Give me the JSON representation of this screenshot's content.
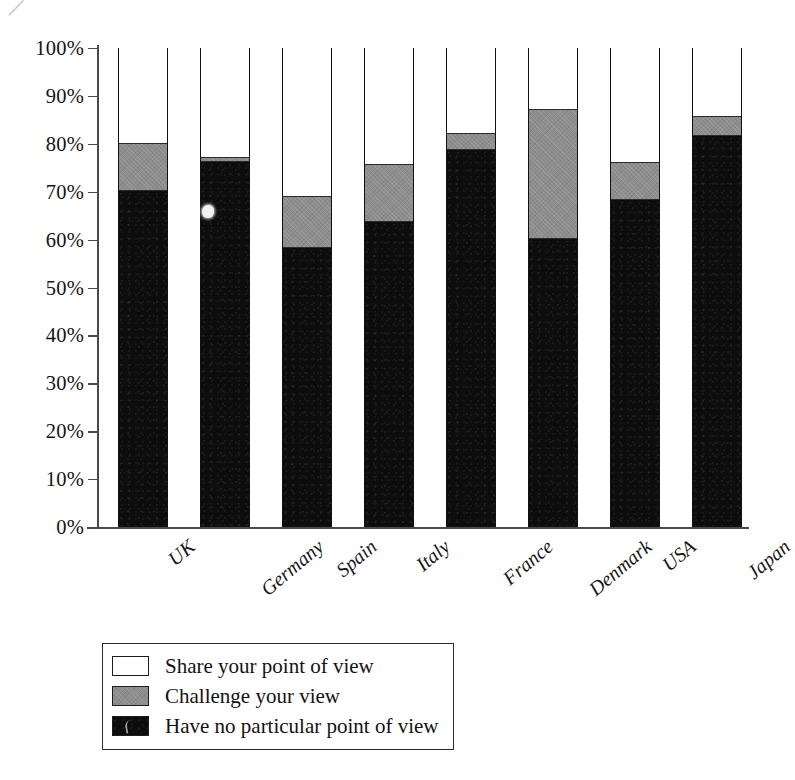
{
  "chart_data": {
    "type": "bar",
    "subtype": "stacked-100-percent",
    "title": "",
    "xlabel": "",
    "ylabel": "",
    "ylim": [
      0,
      100
    ],
    "yticks": [
      "0%",
      "10%",
      "20%",
      "30%",
      "40%",
      "50%",
      "60%",
      "70%",
      "80%",
      "90%",
      "100%"
    ],
    "ytick_values": [
      0,
      10,
      20,
      30,
      40,
      50,
      60,
      70,
      80,
      90,
      100
    ],
    "grid": false,
    "legend_position": "bottom-left",
    "categories": [
      "UK",
      "Germany",
      "Spain",
      "Italy",
      "France",
      "Denmark",
      "USA",
      "Japan"
    ],
    "series": [
      {
        "name": "Have no particular point of view",
        "color": "#0d0d0d",
        "values": [
          70,
          76,
          58,
          63.5,
          78.5,
          60,
          68,
          81.5
        ]
      },
      {
        "name": "Challenge your view",
        "color": "#8d8d8d",
        "values": [
          10,
          1,
          11,
          12,
          3.5,
          27,
          8,
          4
        ]
      },
      {
        "name": "Share your point of view",
        "color": "#ffffff",
        "values": [
          20,
          23,
          31,
          24.5,
          18,
          13,
          24,
          14.5
        ]
      }
    ],
    "cumulative_tops": {
      "black": [
        70,
        76,
        58,
        63.5,
        78.5,
        60,
        68,
        81.5
      ],
      "gray": [
        80,
        77,
        69,
        75.5,
        82,
        87,
        76,
        85.5
      ],
      "white": [
        100,
        100,
        100,
        100,
        100,
        100,
        100,
        100
      ]
    }
  },
  "legend": {
    "items": [
      {
        "label": "Share your point of view",
        "swatch": "white"
      },
      {
        "label": "Challenge your view",
        "swatch": "gray"
      },
      {
        "label": "Have no particular point of view",
        "swatch": "black"
      }
    ]
  },
  "artifact": {
    "mark": "⁄"
  }
}
